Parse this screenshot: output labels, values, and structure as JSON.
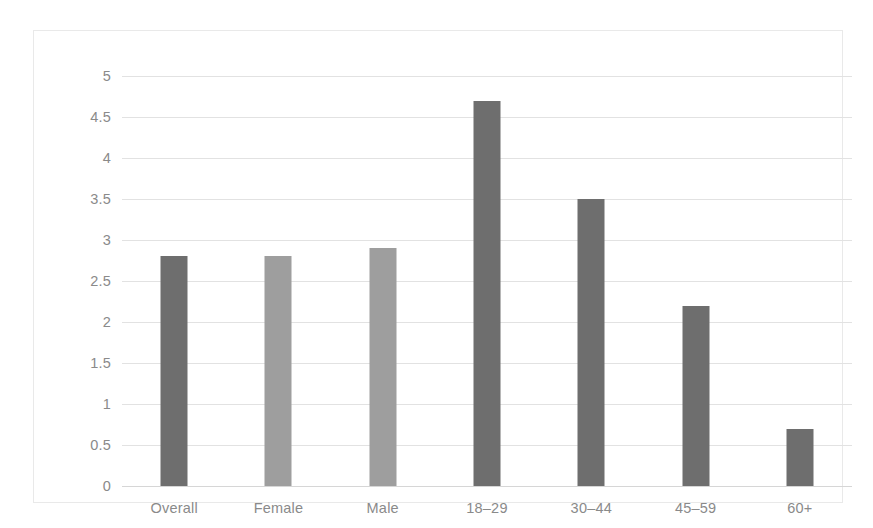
{
  "chart_data": {
    "type": "bar",
    "title": "",
    "subtitle": "",
    "xlabel": "",
    "ylabel": "",
    "categories": [
      "Overall",
      "Female",
      "Male",
      "18–29",
      "30–44",
      "45–59",
      "60+"
    ],
    "values": [
      2.8,
      2.8,
      2.9,
      4.7,
      3.5,
      2.2,
      0.7
    ],
    "bar_colors": [
      "#6e6e6e",
      "#9e9e9e",
      "#9e9e9e",
      "#6e6e6e",
      "#6e6e6e",
      "#6e6e6e",
      "#6e6e6e"
    ],
    "ylim": [
      0,
      5
    ],
    "ytick_step": 0.5,
    "ytick_labels": [
      "5",
      "4.5",
      "4",
      "3.5",
      "3",
      "2.5",
      "2",
      "1.5",
      "1",
      "0.5",
      "0"
    ],
    "ytick_values": [
      5,
      4.5,
      4,
      3.5,
      3,
      2.5,
      2,
      1.5,
      1,
      0.5,
      0
    ],
    "grid": true,
    "grid_axis": "y",
    "legend": false,
    "legend_position": "none",
    "series": [
      {
        "name": "",
        "values": [
          2.8,
          2.8,
          2.9,
          4.7,
          3.5,
          2.2,
          0.7
        ]
      }
    ],
    "colors": {
      "bar_dark": "#6e6e6e",
      "bar_light": "#9e9e9e",
      "gridline": "#e2e2e2",
      "axis_line": "#d6d6d6",
      "tick_text": "#8a8a8a",
      "frame_border": "#e9e9e9",
      "background": "#ffffff"
    }
  }
}
